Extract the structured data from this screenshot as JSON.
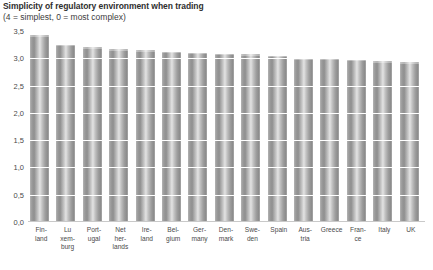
{
  "chart_data": {
    "type": "bar",
    "title": "Simplicity of regulatory environment when trading",
    "subtitle": "(4 = simplest, 0 = most complex)",
    "xlabel": "",
    "ylabel": "",
    "ylim": [
      0,
      3.5
    ],
    "grid": true,
    "legend": "none",
    "decimal_separator": ",",
    "ytick_labels": [
      "3,5",
      "3,0",
      "2,5",
      "2,0",
      "1,5",
      "1,0",
      "0,5",
      "0,0"
    ],
    "ytick_values": [
      3.5,
      3.0,
      2.5,
      2.0,
      1.5,
      1.0,
      0.5,
      0.0
    ],
    "categories": [
      "Finland",
      "Luxemburg",
      "Portugal",
      "Netherlands",
      "Ireland",
      "Belgium",
      "Germany",
      "Denmark",
      "Sweden",
      "Spain",
      "Austria",
      "Greece",
      "France",
      "Italy",
      "UK"
    ],
    "category_label_lines": [
      [
        "Fin-",
        "land"
      ],
      [
        "Lu",
        "xem-",
        "burg"
      ],
      [
        "Port-",
        "ugal"
      ],
      [
        "Net",
        "her-",
        "lands"
      ],
      [
        "Ire-",
        "land"
      ],
      [
        "Bel-",
        "gium"
      ],
      [
        "Ger-",
        "many"
      ],
      [
        "Den-",
        "mark"
      ],
      [
        "Swe-",
        "den"
      ],
      [
        "Spain"
      ],
      [
        "Aus-",
        "tria"
      ],
      [
        "Greece"
      ],
      [
        "Fran-",
        "ce"
      ],
      [
        "Italy"
      ],
      [
        "UK"
      ]
    ],
    "values": [
      3.42,
      3.25,
      3.2,
      3.17,
      3.15,
      3.12,
      3.1,
      3.08,
      3.07,
      3.05,
      3.0,
      3.0,
      2.97,
      2.95,
      2.93
    ]
  },
  "colors": {
    "background": "#ffffff",
    "bar_light": "#e3e3e3",
    "bar_mid": "#b4b4b4",
    "bar_dark": "#8d8d8d",
    "gridline": "#ffffff",
    "baseline": "#c9c9c9",
    "title_text": "#2e2e2e",
    "tick_text": "#4a4a4a"
  }
}
